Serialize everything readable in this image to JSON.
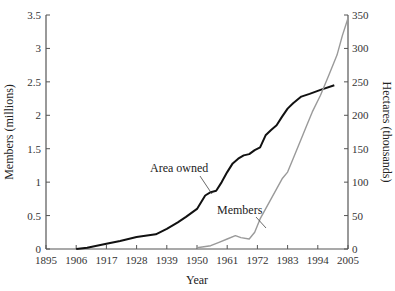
{
  "chart_data": {
    "type": "line",
    "title": "",
    "xlabel": "Year",
    "ylabel": "Members (millions)",
    "ylabel_right": "Hectares (thousands)",
    "xlim": [
      1895,
      2005
    ],
    "ylim": [
      0,
      3.5
    ],
    "ylim_right": [
      0,
      350
    ],
    "grid": false,
    "legend": "none (inline annotations)",
    "x_ticks": [
      "1895",
      "1906",
      "1917",
      "1928",
      "1939",
      "1950",
      "1961",
      "1972",
      "1983",
      "1994",
      "2005"
    ],
    "y_ticks_left": [
      "0",
      "0.5",
      "1",
      "1.5",
      "2",
      "2.5",
      "3",
      "3.5"
    ],
    "y_ticks_right": [
      "0",
      "50",
      "100",
      "150",
      "200",
      "250",
      "300",
      "350"
    ],
    "annotations": [
      "Area owned",
      "Members"
    ],
    "series": [
      {
        "name": "Area owned",
        "axis": "right",
        "units": "hectares (thousands)",
        "color": "#111111",
        "x": [
          1906,
          1910,
          1917,
          1922,
          1928,
          1935,
          1939,
          1943,
          1946,
          1950,
          1953,
          1955,
          1957,
          1959,
          1961,
          1963,
          1965,
          1967,
          1969,
          1971,
          1973,
          1975,
          1977,
          1979,
          1981,
          1983,
          1985,
          1988,
          1991,
          1995,
          2000
        ],
        "values": [
          0,
          2,
          8,
          12,
          18,
          22,
          30,
          40,
          48,
          60,
          80,
          85,
          87,
          100,
          115,
          128,
          135,
          140,
          142,
          148,
          152,
          170,
          178,
          185,
          198,
          210,
          218,
          228,
          232,
          238,
          245
        ]
      },
      {
        "name": "Members",
        "axis": "left",
        "units": "millions",
        "color": "#9a9a9a",
        "x": [
          1950,
          1955,
          1958,
          1961,
          1964,
          1966,
          1969,
          1971,
          1973,
          1975,
          1977,
          1979,
          1981,
          1983,
          1985,
          1988,
          1990,
          1992,
          1995,
          1998,
          2001,
          2003,
          2005
        ],
        "values": [
          0.02,
          0.05,
          0.1,
          0.15,
          0.2,
          0.17,
          0.15,
          0.25,
          0.45,
          0.6,
          0.75,
          0.9,
          1.05,
          1.15,
          1.35,
          1.65,
          1.85,
          2.05,
          2.3,
          2.6,
          2.9,
          3.2,
          3.45
        ]
      }
    ]
  }
}
